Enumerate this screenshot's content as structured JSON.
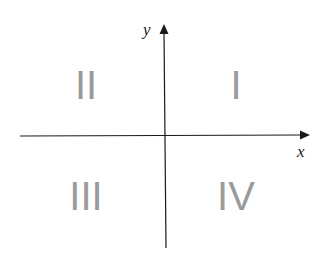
{
  "diagram": {
    "type": "cartesian-quadrants",
    "axes": {
      "x_label": "x",
      "y_label": "y"
    },
    "quadrants": [
      {
        "id": "I",
        "label": "I",
        "position": "top-right"
      },
      {
        "id": "II",
        "label": "II",
        "position": "top-left"
      },
      {
        "id": "III",
        "label": "III",
        "position": "bottom-left"
      },
      {
        "id": "IV",
        "label": "IV",
        "position": "bottom-right"
      }
    ],
    "colors": {
      "axis": "#1a1a1a",
      "quadrant_label": "#9a9a9a",
      "background": "#ffffff"
    }
  }
}
